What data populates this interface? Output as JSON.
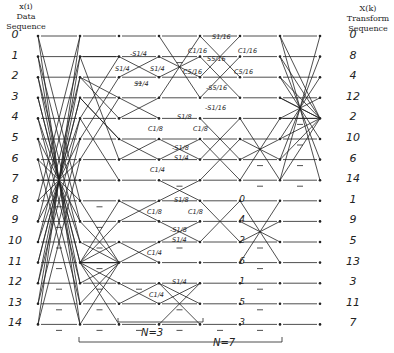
{
  "header": {
    "input_title": [
      "x(i)",
      "Data",
      "Sequence"
    ],
    "output_title": [
      "X(k)",
      "Transform",
      "Sequence"
    ]
  },
  "input_indices": [
    "0",
    "1",
    "2",
    "3",
    "4",
    "5",
    "6",
    "7",
    "8",
    "9",
    "10",
    "11",
    "12",
    "13",
    "14"
  ],
  "output_indices": [
    "0",
    "8",
    "4",
    "12",
    "2",
    "10",
    "6",
    "14",
    "1",
    "9",
    "5",
    "13",
    "3",
    "11",
    "7"
  ],
  "intermediate_indices": [
    "0",
    "4",
    "2",
    "6",
    "1",
    "5",
    "3"
  ],
  "twiddle_labels": {
    "s14_top": "-S1/4",
    "s14_l": "S1/4",
    "s14_r": "S1/4",
    "s14_bot": "S1/4",
    "s116": "S1/16",
    "c116_l": "C1/16",
    "c116_r": "C1/16",
    "s516": "S5/16",
    "c516_l": "C5/16",
    "c516_r": "C5/16",
    "ms516": "-S5/16",
    "ms116": "-S1/16",
    "s18_a": "S1/8",
    "c18_al": "C1/8",
    "c18_ar": "C1/8",
    "ms18_a": "-S1/8",
    "s14_b": "S1/4",
    "c14_b": "C1/4",
    "s18_c": "S1/8",
    "c18_cl": "C1/8",
    "c18_cr": "C1/8",
    "ms18_c": "-S1/8",
    "s14_d": "S1/4",
    "c14_d": "C1/4",
    "s14_e": "S1/4",
    "c14_e": "C1/4"
  },
  "brackets": {
    "n3": "N=3",
    "n7": "N=7"
  }
}
